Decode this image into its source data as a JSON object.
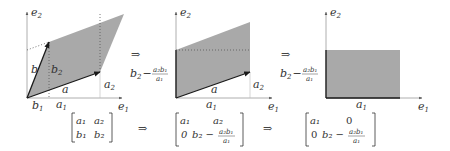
{
  "colors": {
    "fill": "#a9a9a9",
    "axis": "#888888",
    "vector": "#1a1a1a",
    "dotted": "#555555",
    "text": "#333333"
  },
  "panels": [
    {
      "id": "original",
      "axis_labels": {
        "x": "e",
        "x_sub": "1",
        "y": "e",
        "y_sub": "2"
      },
      "vector_labels": {
        "a": "a",
        "b": "b"
      },
      "component_labels": {
        "a1": "a",
        "a1_sub": "1",
        "a2": "a",
        "a2_sub": "2",
        "b1": "b",
        "b1_sub": "1",
        "b2": "b",
        "b2_sub": "2"
      }
    },
    {
      "id": "sheared",
      "axis_labels": {
        "x": "e",
        "x_sub": "1",
        "y": "e",
        "y_sub": "2"
      },
      "vector_labels": {
        "a": "a"
      },
      "component_labels": {
        "a1": "a",
        "a1_sub": "1",
        "a2": "a",
        "a2_sub": "2"
      },
      "height_label": {
        "base": "b",
        "base_sub": "2",
        "minus": "−",
        "num": "a₂b₁",
        "den": "a₁"
      }
    },
    {
      "id": "rectangle",
      "axis_labels": {
        "x": "e",
        "x_sub": "1",
        "y": "e",
        "y_sub": "2"
      },
      "component_labels": {
        "a1": "a",
        "a1_sub": "1"
      },
      "height_label": {
        "base": "b",
        "base_sub": "2",
        "minus": "−",
        "num": "a₂b₁",
        "den": "a₁"
      }
    }
  ],
  "arrows": {
    "implies": "⇒"
  },
  "matrices": [
    {
      "rows": [
        [
          "a₁",
          "a₂"
        ],
        [
          "b₁",
          "b₂"
        ]
      ]
    },
    {
      "rows": [
        [
          "a₁",
          "a₂"
        ],
        [
          "0",
          "b₂ − a₂b₁/a₁"
        ]
      ],
      "cell_11": {
        "base": "b₂ −",
        "num": "a₂b₁",
        "den": "a₁"
      }
    },
    {
      "rows": [
        [
          "a₁",
          "0"
        ],
        [
          "0",
          "b₂ − a₂b₁/a₁"
        ]
      ],
      "cell_11": {
        "base": "b₂ −",
        "num": "a₂b₁",
        "den": "a₁"
      }
    }
  ]
}
